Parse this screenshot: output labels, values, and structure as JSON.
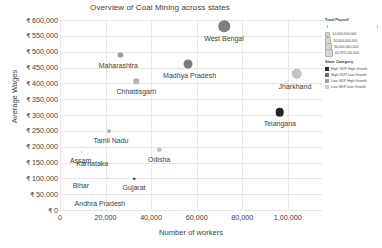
{
  "chart_data": {
    "type": "scatter",
    "title": "Overview of Coal Mining across states",
    "xlabel": "Number of workers",
    "ylabel": "Average Wages",
    "xlim": [
      0,
      115000
    ],
    "ylim": [
      0,
      600000
    ],
    "grid": true,
    "xticks": [
      "0",
      "20,000",
      "40,000",
      "60,000",
      "80,000",
      "1,00,000"
    ],
    "xtick_values": [
      0,
      20000,
      40000,
      60000,
      80000,
      100000
    ],
    "yticks": [
      "₹ 0",
      "₹ 50,000",
      "₹ 100,000",
      "₹ 150,000",
      "₹ 200,000",
      "₹ 250,000",
      "₹ 300,000",
      "₹ 350,000",
      "₹ 400,000",
      "₹ 450,000",
      "₹ 500,000",
      "₹ 550,000",
      "₹ 600,000"
    ],
    "ytick_values": [
      0,
      50000,
      100000,
      150000,
      200000,
      250000,
      300000,
      350000,
      400000,
      450000,
      500000,
      550000,
      600000
    ],
    "size_field": "Total Payroll",
    "color_field": "State Category",
    "points": [
      {
        "label": "West Bengal",
        "x": 72000,
        "y": 580000,
        "size": 11.5,
        "color": "#808080",
        "label_dx": 0,
        "label_dy": 9
      },
      {
        "label": "Maharashtra",
        "x": 26500,
        "y": 491000,
        "size": 5.2,
        "color": "#9e9e9e",
        "label_dx": -2,
        "label_dy": 7
      },
      {
        "label": "Madhya Pradesh",
        "x": 56000,
        "y": 462000,
        "size": 9.0,
        "color": "#7a7a7a",
        "label_dx": 2,
        "label_dy": 8
      },
      {
        "label": "Jharkhand",
        "x": 104000,
        "y": 430000,
        "size": 10.5,
        "color": "#c4c4c4",
        "label_dx": -2,
        "label_dy": 9
      },
      {
        "label": "Chhattisgarh",
        "x": 33500,
        "y": 407000,
        "size": 5.6,
        "color": "#b5b5b5",
        "label_dx": 0,
        "label_dy": 7
      },
      {
        "label": "Telangana",
        "x": 96500,
        "y": 308000,
        "size": 8.6,
        "color": "#262626",
        "label_dx": 0,
        "label_dy": 8
      },
      {
        "label": "Tamil Nadu",
        "x": 21500,
        "y": 249000,
        "size": 4.0,
        "color": "#b0b0b0",
        "label_dx": 2,
        "label_dy": 6
      },
      {
        "label": "Odisha",
        "x": 43500,
        "y": 190000,
        "size": 4.6,
        "color": "#c0c0c0",
        "label_dx": 0,
        "label_dy": 6
      },
      {
        "label": "Assam",
        "x": 9500,
        "y": 182000,
        "size": 1.8,
        "color": "#bdbdbd",
        "label_dx": -1,
        "label_dy": 5
      },
      {
        "label": "Karnataka",
        "x": 8000,
        "y": 147000,
        "size": 1.4,
        "color": "#b8b8b8",
        "label_dx": 14,
        "label_dy": -3
      },
      {
        "label": "Bihar",
        "x": 21000,
        "y": 101000,
        "size": 1.6,
        "color": "#c2c2c2",
        "label_dx": -27,
        "label_dy": 4
      },
      {
        "label": "Gujarat",
        "x": 32500,
        "y": 99000,
        "size": 2.6,
        "color": "#3a3a3a",
        "label_dx": 0,
        "label_dy": 5
      },
      {
        "label": "Andhra Pradesh",
        "x": 14000,
        "y": 44000,
        "size": 1.2,
        "color": "#c8c8c8",
        "label_dx": 8,
        "label_dy": 4
      }
    ]
  },
  "legend": {
    "size_legend": {
      "title": "Total Payroll",
      "items": [
        {
          "value": "10,000,000,000",
          "swatch": 3.2
        },
        {
          "value": "20,000,000,000",
          "swatch": 4.2
        },
        {
          "value": "30,000,000,000",
          "swatch": 5.0
        },
        {
          "value": "44,193,500,000",
          "swatch": 5.8
        }
      ]
    },
    "category_legend": {
      "title": "State Category",
      "items": [
        {
          "label": "High GDP-High Growth",
          "color": "#2b2b2b"
        },
        {
          "label": "High GDP-Low Growth",
          "color": "#6e6e6e"
        },
        {
          "label": "Low GDP-High Growth",
          "color": "#a0a0a0"
        },
        {
          "label": "Low GDP-Low Growth",
          "color": "#cfcfcf"
        }
      ]
    }
  }
}
